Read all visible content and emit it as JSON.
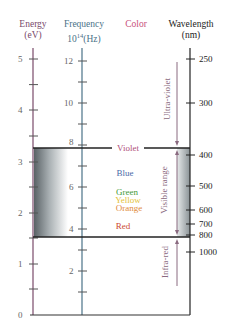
{
  "headers": {
    "energy": {
      "title": "Energy",
      "unit": "(eV)"
    },
    "frequency": {
      "title": "Frequency",
      "unit_base": "10",
      "unit_exp": "14",
      "unit_suffix": "(Hz)"
    },
    "color": {
      "title": "Color"
    },
    "wavelength": {
      "title": "Wavelength",
      "unit": "(nm)"
    }
  },
  "energy_axis": {
    "labels": [
      "0",
      "1",
      "2",
      "3",
      "4",
      "5"
    ]
  },
  "frequency_axis": {
    "labels": [
      "2",
      "4",
      "6",
      "8",
      "10",
      "12"
    ]
  },
  "wavelength_axis": {
    "labels": [
      "250",
      "300",
      "400",
      "500",
      "600",
      "700",
      "800",
      "1000"
    ]
  },
  "colors": {
    "violet": {
      "label": "Violet",
      "hex": "#b0507a"
    },
    "blue": {
      "label": "Blue",
      "hex": "#4a6aa8"
    },
    "green": {
      "label": "Green",
      "hex": "#3f9a3a"
    },
    "yellow": {
      "label": "Yellow",
      "hex": "#e4c23a"
    },
    "orange": {
      "label": "Orange",
      "hex": "#e08a3a"
    },
    "red": {
      "label": "Red",
      "hex": "#cc4a30"
    }
  },
  "ranges": {
    "ultraviolet": "Ultra-violet",
    "visible": "Visible range",
    "infrared": "Infra-red"
  },
  "style": {
    "energy_color": "#7a4a6a",
    "frequency_color": "#4a7288",
    "color_header": "#c8507a",
    "axis_black": "#222222"
  }
}
